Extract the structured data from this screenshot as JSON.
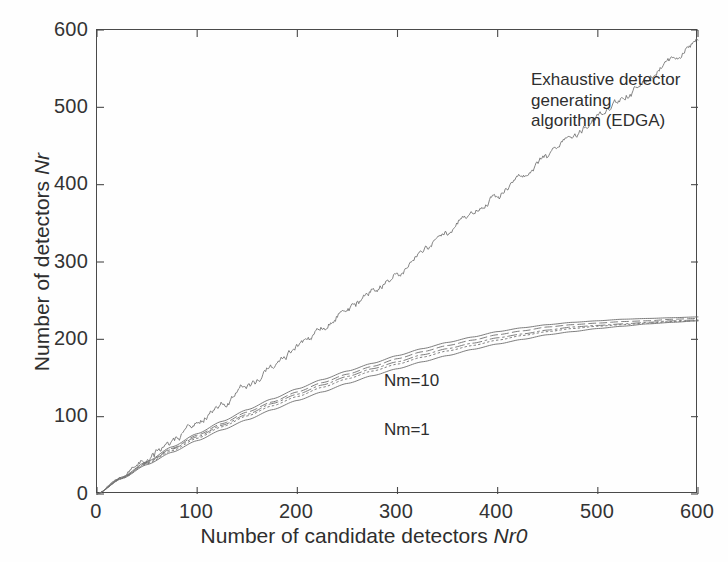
{
  "figure": {
    "background": "#fefefe",
    "axis_color": "#4a4a4a",
    "curve_color": "#6e6e6e",
    "text_color": "#2e2e2e"
  },
  "annotations": {
    "edga": "Exhaustive detector generating\nalgorithm (EDGA)",
    "nm10": "Nm=10",
    "nm1": "Nm=1"
  },
  "chart_data": {
    "type": "line",
    "title": "",
    "xlabel": "Number of candidate detectors Nr0",
    "ylabel": "Number of detectors Nr",
    "xlim": [
      0,
      600
    ],
    "ylim": [
      0,
      600
    ],
    "xticks": [
      0,
      100,
      200,
      300,
      400,
      500,
      600
    ],
    "yticks": [
      0,
      100,
      200,
      300,
      400,
      500,
      600
    ],
    "xtick_labels": [
      "0",
      "100",
      "200",
      "300",
      "400",
      "500",
      "600"
    ],
    "ytick_labels": [
      "0",
      "100",
      "200",
      "300",
      "400",
      "500",
      "600"
    ],
    "grid": false,
    "legend": "none (curves labelled in-plot)",
    "x": [
      0,
      25,
      50,
      75,
      100,
      125,
      150,
      175,
      200,
      225,
      250,
      275,
      300,
      325,
      350,
      375,
      400,
      425,
      450,
      475,
      500,
      525,
      550,
      575,
      600
    ],
    "series": [
      {
        "name": "Exhaustive detector generating algorithm (EDGA)",
        "style": "noisy-solid",
        "label_in_plot": "Exhaustive detector generating algorithm (EDGA)",
        "values": [
          0,
          22,
          45,
          68,
          92,
          116,
          140,
          164,
          188,
          213,
          238,
          262,
          288,
          313,
          338,
          363,
          388,
          412,
          437,
          462,
          488,
          512,
          538,
          563,
          589
        ],
        "noise_amplitude": 5
      },
      {
        "name": "Nm=10",
        "style": "solid",
        "label_in_plot": "Nm=10",
        "values": [
          0,
          22,
          42,
          61,
          78,
          94,
          109,
          123,
          136,
          148,
          159,
          169,
          179,
          188,
          196,
          203,
          210,
          215,
          219,
          222,
          224,
          226,
          227,
          228,
          229
        ]
      },
      {
        "name": "Nm=5",
        "style": "dashed",
        "values": [
          0,
          21,
          41,
          59,
          76,
          91,
          106,
          119,
          132,
          144,
          155,
          165,
          175,
          184,
          192,
          199,
          206,
          211,
          216,
          219,
          221,
          223,
          224,
          226,
          227
        ]
      },
      {
        "name": "Nm=3",
        "style": "dashdot",
        "values": [
          0,
          21,
          40,
          58,
          74,
          89,
          103,
          117,
          129,
          141,
          152,
          162,
          171,
          180,
          188,
          195,
          202,
          207,
          212,
          216,
          218,
          220,
          222,
          224,
          225
        ]
      },
      {
        "name": "Nm=2",
        "style": "dotted",
        "values": [
          0,
          20,
          39,
          56,
          72,
          87,
          101,
          114,
          126,
          138,
          149,
          159,
          168,
          177,
          185,
          192,
          199,
          205,
          210,
          214,
          217,
          219,
          221,
          223,
          224
        ]
      },
      {
        "name": "Nm=1",
        "style": "solid",
        "label_in_plot": "Nm=1",
        "values": [
          0,
          20,
          38,
          54,
          69,
          83,
          96,
          109,
          121,
          132,
          143,
          153,
          162,
          171,
          179,
          187,
          194,
          200,
          206,
          210,
          214,
          217,
          220,
          222,
          224
        ]
      }
    ]
  }
}
